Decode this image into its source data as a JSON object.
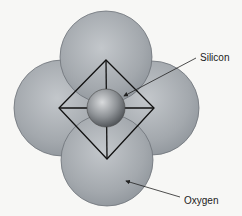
{
  "diagram": {
    "labels": {
      "silicon": "Silicon",
      "oxygen": "Oxygen"
    },
    "colors": {
      "background": "#f7f7f5",
      "oxygen_fill": "#a4a9ae",
      "silicon_fill": "#8e9296",
      "outline": "#111111"
    }
  }
}
